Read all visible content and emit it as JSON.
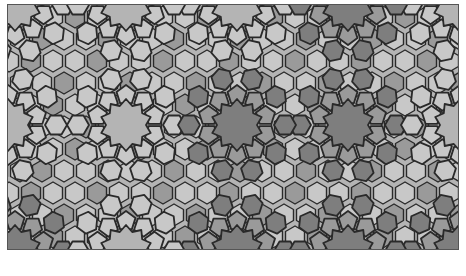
{
  "image": {
    "description": "Grayscale Islamic geometric tiling pattern with interlaced 10-fold rosettes",
    "colors": {
      "background": "#b4b4b4",
      "light": "#c8c8c8",
      "medium": "#9a9a9a",
      "dark": "#7e7e7e",
      "line": "#2a2a2a"
    },
    "rosette_centers": [
      [
        118,
        120
      ],
      [
        340,
        120
      ],
      [
        229,
        0
      ],
      [
        229,
        246
      ],
      [
        7,
        0
      ],
      [
        7,
        246
      ],
      [
        451,
        0
      ],
      [
        451,
        246
      ],
      [
        118,
        0
      ],
      [
        340,
        0
      ],
      [
        118,
        246
      ],
      [
        340,
        246
      ],
      [
        0,
        120
      ],
      [
        229,
        120
      ],
      [
        452,
        120
      ]
    ]
  }
}
